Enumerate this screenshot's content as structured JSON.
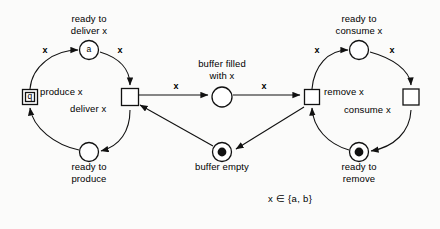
{
  "diagram": {
    "formula": "x ∈ {a, b}",
    "colors": {
      "ink": "#111111",
      "paper": "#fbfbfa",
      "token": "#111111"
    }
  },
  "places": [
    {
      "id": "ready-to-deliver",
      "label": "ready to\ndeliver x",
      "inner_label": "a",
      "tokens": 0,
      "cx": 89,
      "cy": 50,
      "r": 9.5,
      "label_x": 89,
      "label_y": 19
    },
    {
      "id": "ready-to-produce",
      "label": "ready to\nproduce",
      "inner_label": "",
      "tokens": 0,
      "cx": 89,
      "cy": 152,
      "r": 9.5,
      "label_x": 89,
      "label_y": 166
    },
    {
      "id": "buffer-filled",
      "label": "buffer filled\nwith x",
      "inner_label": "",
      "tokens": 0,
      "cx": 222,
      "cy": 97,
      "r": 10.0,
      "label_x": 222,
      "label_y": 64
    },
    {
      "id": "buffer-empty",
      "label": "buffer empty",
      "inner_label": "",
      "tokens": 1,
      "cx": 222,
      "cy": 152,
      "r": 9.5,
      "label_x": 222,
      "label_y": 166
    },
    {
      "id": "ready-to-consume",
      "label": "ready to\nconsume x",
      "inner_label": "",
      "tokens": 0,
      "cx": 359,
      "cy": 50,
      "r": 9.5,
      "label_x": 359,
      "label_y": 19
    },
    {
      "id": "ready-to-remove",
      "label": "ready to\nremove",
      "inner_label": "",
      "tokens": 1,
      "cx": 359,
      "cy": 152,
      "r": 9.5,
      "label_x": 359,
      "label_y": 166
    }
  ],
  "transitions": [
    {
      "id": "produce",
      "label": "produce x",
      "inner_label": "q",
      "cx": 30,
      "cy": 97,
      "size": 15,
      "label_x": 40,
      "label_y": 91,
      "align": "left"
    },
    {
      "id": "deliver",
      "label": "deliver x",
      "inner_label": "",
      "cx": 130,
      "cy": 97,
      "size": 17,
      "label_x": 116,
      "label_y": 103,
      "align": "right"
    },
    {
      "id": "remove",
      "label": "remove x",
      "inner_label": "",
      "cx": 312,
      "cy": 97,
      "size": 15,
      "label_x": 324,
      "label_y": 91,
      "align": "left"
    },
    {
      "id": "consume",
      "label": "consume x",
      "inner_label": "",
      "cx": 411,
      "cy": 97,
      "size": 16,
      "label_x": 398,
      "label_y": 103,
      "align": "right"
    }
  ],
  "arc_labels": [
    {
      "id": "produce-to-ready-deliver",
      "text": "x",
      "x": 45,
      "y": 50
    },
    {
      "id": "ready-deliver-to-deliver",
      "text": "x",
      "x": 120,
      "y": 50
    },
    {
      "id": "deliver-to-buffer-filled",
      "text": "x",
      "x": 176,
      "y": 86
    },
    {
      "id": "buffer-filled-to-remove",
      "text": "x",
      "x": 264,
      "y": 86
    },
    {
      "id": "remove-to-ready-consume",
      "text": "x",
      "x": 317,
      "y": 50
    },
    {
      "id": "ready-consume-to-consume",
      "text": "x",
      "x": 392,
      "y": 50
    }
  ],
  "formula_pos": {
    "x": 290,
    "y": 198
  }
}
